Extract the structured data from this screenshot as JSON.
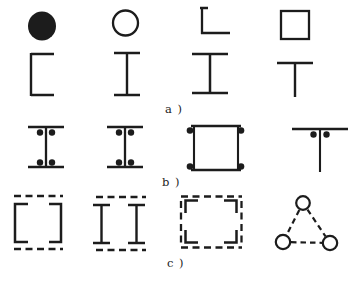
{
  "figure": {
    "captions": {
      "a": "a )",
      "b": "b )",
      "c": "c )"
    },
    "colors": {
      "ink": "#1c1c1c",
      "paper": "#ffffff"
    },
    "rows": [
      {
        "caption_key": "a",
        "group": "single rolled sections",
        "shapes": [
          "solid-circle-section",
          "hollow-circle-section",
          "angle-section",
          "hollow-square-section",
          "channel-section",
          "i-beam-section",
          "wide-i-beam-section",
          "tee-section"
        ]
      },
      {
        "caption_key": "b",
        "group": "riveted built-up sections",
        "shapes": [
          "riveted-i-section-1",
          "riveted-i-section-2",
          "riveted-box-section",
          "riveted-tee-section"
        ]
      },
      {
        "caption_key": "c",
        "group": "laced built-up sections",
        "shapes": [
          "laced-double-channel-section",
          "laced-double-i-section",
          "laced-four-angle-section",
          "laced-three-tube-section"
        ]
      }
    ]
  }
}
